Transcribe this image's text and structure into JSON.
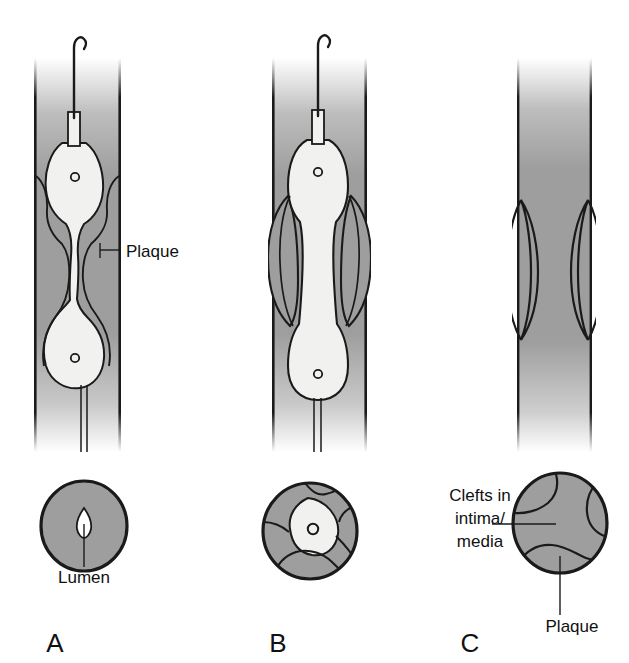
{
  "figure": {
    "background_color": "#ffffff",
    "ink_color": "#1a1a1a"
  },
  "colors": {
    "plaque_fill": "#9e9e9e",
    "plaque_fill_dark": "#8f8f8f",
    "balloon_fill": "#f1f1ef",
    "vessel_wall": "#1a1a1a",
    "outline": "#1a1a1a",
    "white": "#ffffff"
  },
  "panels": [
    {
      "id": "A",
      "label": "A",
      "label_x": 55,
      "label_y": 650,
      "longitudinal": {
        "name": "artery-longitudinal-section-a",
        "description": "Balloon catheter with guidewire inside a plaque-narrowed artery; balloon only partly inflated, waist at the plaque",
        "has_guidewire": true,
        "has_balloon": true,
        "balloon_state": "partially-inflated"
      },
      "cross_section": {
        "name": "artery-cross-section-a",
        "description": "Round artery almost filled with plaque, leaving a tiny slit-like lumen",
        "lumen_visible": true,
        "clefts": 0
      },
      "annotations": [
        {
          "name": "plaque-label-a",
          "text": "Plaque",
          "text_x": 126,
          "text_y": 257,
          "anchor": "start",
          "leader": "M 100 250 L 121 250"
        },
        {
          "name": "lumen-label-a",
          "text": "Lumen",
          "text_x": 84,
          "text_y": 583,
          "anchor": "middle",
          "leader": "M 84 567 L 84 524"
        }
      ]
    },
    {
      "id": "B",
      "label": "B",
      "label_x": 278,
      "label_y": 650,
      "longitudinal": {
        "name": "artery-longitudinal-section-b",
        "description": "Balloon fully inflated, compressing and splitting the plaque outward against the vessel wall",
        "has_guidewire": true,
        "has_balloon": true,
        "balloon_state": "fully-inflated"
      },
      "cross_section": {
        "name": "artery-cross-section-b",
        "description": "Cross section during inflation: plaque fractured into segments around an enlarged lumen containing the balloon",
        "lumen_visible": true,
        "clefts": 4
      },
      "annotations": []
    },
    {
      "id": "C",
      "label": "C",
      "label_x": 470,
      "label_y": 650,
      "longitudinal": {
        "name": "artery-longitudinal-section-c",
        "description": "After balloon removal: widened artery with lens-shaped clefts in the intima and media where plaque was split",
        "has_guidewire": false,
        "has_balloon": false,
        "balloon_state": "removed"
      },
      "cross_section": {
        "name": "artery-cross-section-c",
        "description": "Cross section after angioplasty showing residual plaque and clefts in intima/media",
        "lumen_visible": false,
        "clefts": 3
      },
      "annotations": [
        {
          "name": "clefts-label-c",
          "text_lines": [
            "Clefts in",
            "intima/",
            "media"
          ],
          "text_x": 480,
          "text_y": 500,
          "line_height": 23,
          "anchor": "middle",
          "leader": "M 490 524 L 555 524"
        },
        {
          "name": "plaque-label-c",
          "text": "Plaque",
          "text_x": 572,
          "text_y": 632,
          "anchor": "middle",
          "leader": "M 560 615 L 560 556"
        }
      ]
    }
  ],
  "annotation_texts": {
    "plaque_a": "Plaque",
    "lumen_a": "Lumen",
    "clefts_c_line1": "Clefts in",
    "clefts_c_line2": "intima/",
    "clefts_c_line3": "media",
    "plaque_c": "Plaque",
    "panel_a": "A",
    "panel_b": "B",
    "panel_c": "C"
  }
}
